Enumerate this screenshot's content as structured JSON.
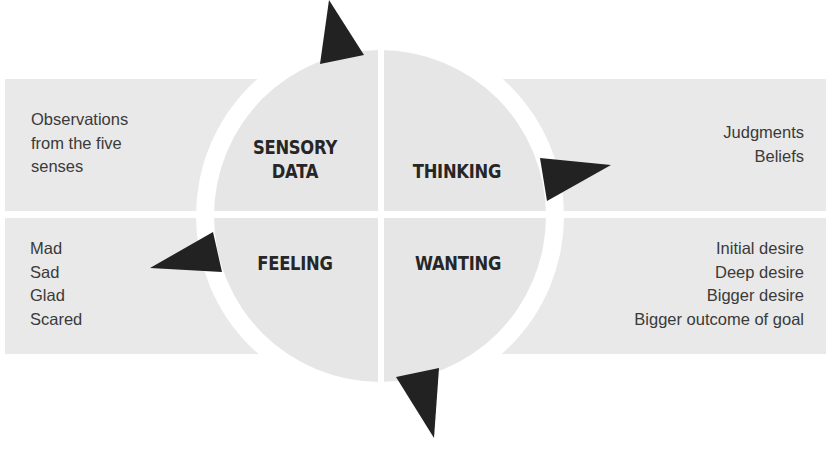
{
  "diagram": {
    "colors": {
      "panel_fill": "#e9e9e9",
      "circle_fill": "#e6e6e6",
      "arrow_fill": "#222222",
      "text": "#3a3a3a",
      "label_text": "#262626"
    },
    "quadrants": [
      {
        "id": "sensory-data",
        "label_line1": "SENSORY",
        "label_line2": "DATA"
      },
      {
        "id": "thinking",
        "label": "THINKING"
      },
      {
        "id": "feeling",
        "label": "FEELING"
      },
      {
        "id": "wanting",
        "label": "WANTING"
      }
    ],
    "panels": {
      "top_left": {
        "lines": [
          "Observations",
          "from the five",
          "senses"
        ]
      },
      "top_right": {
        "lines": [
          "Judgments",
          "Beliefs"
        ]
      },
      "bottom_left": {
        "lines": [
          "Mad",
          "Sad",
          "Glad",
          "Scared"
        ]
      },
      "bottom_right": {
        "lines": [
          "Initial desire",
          "Deep desire",
          "Bigger desire",
          "Bigger outcome of goal"
        ]
      }
    },
    "arrows": [
      "arrow-up",
      "arrow-right",
      "arrow-down",
      "arrow-left"
    ]
  }
}
